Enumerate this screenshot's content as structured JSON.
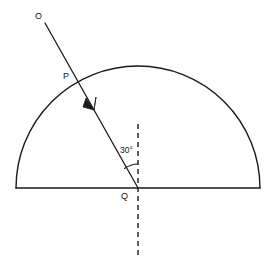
{
  "figure": {
    "background_color": "#ffffff",
    "stroke_color": "#1a1a1a",
    "width": 275,
    "height": 277
  },
  "labels": {
    "source_point": "O",
    "entry_point": "P",
    "centre_point": "Q",
    "angle": "30°"
  },
  "geometry": {
    "semicircle": {
      "centre_x": 138,
      "centre_y": 188,
      "radius": 122,
      "base_left_x": 16,
      "base_right_x": 260,
      "base_y": 188
    },
    "incident_ray": {
      "from_x": 45,
      "from_y": 23,
      "to_x": 138,
      "to_y": 188,
      "arrow_x": 93,
      "arrow_y": 108
    },
    "normal_line": {
      "x": 138,
      "top_y": 124,
      "bottom_y": 258,
      "style": "dashed"
    },
    "angle_marker": {
      "vertex_x": 138,
      "vertex_y": 188,
      "radius": 24,
      "value_degrees": 30
    }
  },
  "icons": {
    "arrowhead": "arrowhead-icon",
    "angle_arc": "angle-arc-icon"
  }
}
